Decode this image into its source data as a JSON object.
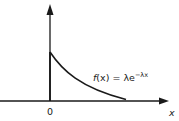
{
  "diagram": {
    "function_label": {
      "prefix": "f",
      "arg": "(x)",
      "equals": " = λe",
      "exponent": "−λx"
    },
    "origin_label": "0",
    "x_axis_label": "x",
    "colors": {
      "stroke": "#1a1a1a",
      "background": "#ffffff"
    }
  }
}
